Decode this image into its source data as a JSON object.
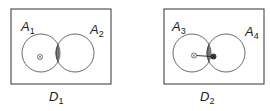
{
  "diagrams": [
    {
      "id": "D1",
      "caption": {
        "main": "D",
        "sub": "1"
      },
      "sets": [
        {
          "main": "A",
          "sub": "1"
        },
        {
          "main": "A",
          "sub": "2"
        }
      ],
      "marker": "circled-x",
      "intersection_shaded": true,
      "has_arrow": false
    },
    {
      "id": "D2",
      "caption": {
        "main": "D",
        "sub": "2"
      },
      "sets": [
        {
          "main": "A",
          "sub": "3"
        },
        {
          "main": "A",
          "sub": "4"
        }
      ],
      "marker": "circled-x",
      "intersection_shaded": true,
      "has_arrow": true
    }
  ],
  "colors": {
    "stroke": "#333333",
    "shade": "#7a7a7a",
    "background": "#ffffff"
  }
}
